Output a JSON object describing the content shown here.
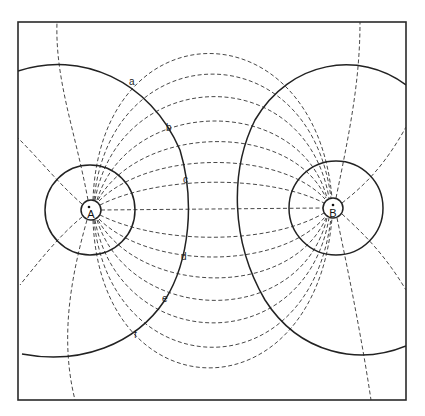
{
  "diagram": {
    "title": "",
    "charges": [
      {
        "id": "A",
        "label": "A",
        "x": 91,
        "y": 210
      },
      {
        "id": "B",
        "label": "B",
        "x": 333,
        "y": 208
      }
    ],
    "equipotential_points": [
      {
        "label": "a",
        "x": 129,
        "y": 81
      },
      {
        "label": "b",
        "x": 169,
        "y": 126
      },
      {
        "label": "c",
        "x": 186,
        "y": 178
      },
      {
        "label": "d",
        "x": 183,
        "y": 258
      },
      {
        "label": "e",
        "x": 164,
        "y": 299
      },
      {
        "label": "f",
        "x": 133,
        "y": 336
      }
    ],
    "legend": {
      "solid": "equipotential line",
      "dashed": "field line"
    },
    "colors": {
      "line": "#222222",
      "background": "#ffffff"
    }
  }
}
